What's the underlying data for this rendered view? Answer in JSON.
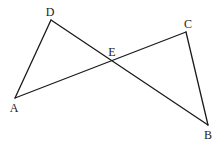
{
  "diagram": {
    "type": "geometry",
    "points": {
      "A": {
        "x": 15,
        "y": 98,
        "label": "A",
        "label_x": 14,
        "label_y": 108
      },
      "D": {
        "x": 51,
        "y": 20,
        "label": "D",
        "label_x": 50,
        "label_y": 12
      },
      "C": {
        "x": 186,
        "y": 32,
        "label": "C",
        "label_x": 188,
        "label_y": 24
      },
      "B": {
        "x": 208,
        "y": 125,
        "label": "B",
        "label_x": 208,
        "label_y": 135
      },
      "E": {
        "x": 111,
        "y": 61,
        "label": "E",
        "label_x": 112,
        "label_y": 52
      }
    },
    "segments": [
      {
        "from": "A",
        "to": "D",
        "name": "segment-AD"
      },
      {
        "from": "D",
        "to": "B",
        "name": "segment-DB"
      },
      {
        "from": "A",
        "to": "C",
        "name": "segment-AC"
      },
      {
        "from": "C",
        "to": "B",
        "name": "segment-CB"
      }
    ],
    "colors": {
      "stroke": "#1a1a1a",
      "background": "#ffffff"
    }
  }
}
